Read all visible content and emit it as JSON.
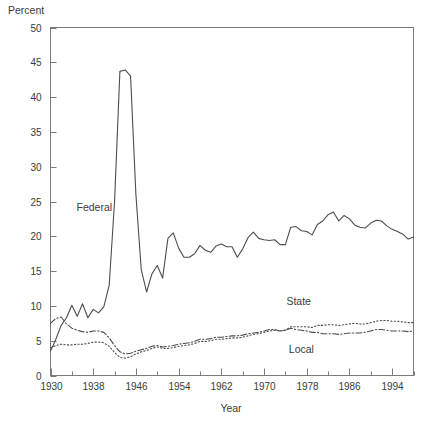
{
  "chart_data": {
    "type": "line",
    "title": "",
    "xlabel": "Year",
    "ylabel": "Percent",
    "ylabel_position": "top-left",
    "xlim": [
      1930,
      1998
    ],
    "ylim": [
      0,
      50
    ],
    "yticks": [
      0,
      5,
      10,
      15,
      20,
      25,
      30,
      35,
      40,
      45,
      50
    ],
    "ytick_labels": [
      "0",
      "5",
      "10",
      "15",
      "20",
      "25",
      "30",
      "35",
      "40",
      "45",
      "50"
    ],
    "xticks_major": [
      1930,
      1938,
      1946,
      1954,
      1962,
      1970,
      1978,
      1986,
      1994
    ],
    "xtick_labels": [
      "1930",
      "1938",
      "1946",
      "1954",
      "1962",
      "1970",
      "1978",
      "1986",
      "1994"
    ],
    "xticks_minor_step": 4,
    "grid": false,
    "legend_position": "inline-annotations",
    "annotations": [
      {
        "text": "Federal",
        "x": 1938.2,
        "y": 23.6
      },
      {
        "text": "State",
        "x": 1976.5,
        "y": 10.2
      },
      {
        "text": "Local",
        "x": 1977.0,
        "y": 3.3
      }
    ],
    "x": [
      1930,
      1931,
      1932,
      1933,
      1934,
      1935,
      1936,
      1937,
      1938,
      1939,
      1940,
      1941,
      1942,
      1943,
      1944,
      1945,
      1946,
      1947,
      1948,
      1949,
      1950,
      1951,
      1952,
      1953,
      1954,
      1955,
      1956,
      1957,
      1958,
      1959,
      1960,
      1961,
      1962,
      1963,
      1964,
      1965,
      1966,
      1967,
      1968,
      1969,
      1970,
      1971,
      1972,
      1973,
      1974,
      1975,
      1976,
      1977,
      1978,
      1979,
      1980,
      1981,
      1982,
      1983,
      1984,
      1985,
      1986,
      1987,
      1988,
      1989,
      1990,
      1991,
      1992,
      1993,
      1994,
      1995,
      1996,
      1997,
      1998
    ],
    "series": [
      {
        "name": "Federal",
        "style": "solid",
        "values": [
          3.5,
          5.2,
          7.2,
          8.3,
          10.1,
          8.5,
          10.3,
          8.3,
          9.5,
          9.0,
          9.9,
          13.0,
          25.0,
          43.7,
          43.9,
          43.0,
          26.0,
          15.2,
          12.0,
          14.6,
          15.8,
          14.0,
          19.7,
          20.5,
          18.3,
          17.0,
          17.0,
          17.5,
          18.7,
          18.0,
          17.7,
          18.6,
          18.9,
          18.5,
          18.5,
          17.0,
          18.2,
          19.8,
          20.6,
          19.7,
          19.5,
          19.4,
          19.5,
          18.8,
          18.8,
          21.3,
          21.4,
          20.8,
          20.7,
          20.2,
          21.7,
          22.2,
          23.1,
          23.5,
          22.2,
          23.0,
          22.5,
          21.6,
          21.3,
          21.2,
          21.9,
          22.3,
          22.2,
          21.5,
          21.0,
          20.7,
          20.3,
          19.6,
          19.9
        ]
      },
      {
        "name": "State",
        "style": "dotted",
        "values": [
          4.0,
          4.3,
          4.5,
          4.4,
          4.4,
          4.5,
          4.5,
          4.6,
          4.8,
          4.8,
          4.7,
          4.2,
          3.3,
          2.6,
          2.5,
          2.7,
          3.1,
          3.4,
          3.6,
          3.9,
          4.1,
          3.9,
          3.9,
          4.0,
          4.2,
          4.3,
          4.4,
          4.6,
          4.9,
          4.9,
          5.0,
          5.2,
          5.2,
          5.3,
          5.4,
          5.4,
          5.5,
          5.7,
          5.9,
          6.0,
          6.2,
          6.4,
          6.5,
          6.4,
          6.5,
          7.0,
          7.0,
          7.0,
          7.0,
          6.9,
          7.2,
          7.2,
          7.3,
          7.3,
          7.2,
          7.3,
          7.4,
          7.5,
          7.4,
          7.4,
          7.6,
          7.8,
          7.9,
          7.9,
          7.8,
          7.8,
          7.7,
          7.6,
          7.6
        ]
      },
      {
        "name": "Local",
        "style": "dashdot",
        "values": [
          7.5,
          8.2,
          8.4,
          7.4,
          6.8,
          6.5,
          6.3,
          6.2,
          6.4,
          6.4,
          6.2,
          5.4,
          4.3,
          3.4,
          3.1,
          3.2,
          3.5,
          3.7,
          3.9,
          4.2,
          4.3,
          4.1,
          4.2,
          4.3,
          4.5,
          4.6,
          4.7,
          4.9,
          5.2,
          5.2,
          5.3,
          5.5,
          5.5,
          5.6,
          5.7,
          5.7,
          5.8,
          6.0,
          6.1,
          6.2,
          6.4,
          6.6,
          6.6,
          6.4,
          6.5,
          6.8,
          6.6,
          6.5,
          6.4,
          6.2,
          6.2,
          6.0,
          6.0,
          6.0,
          5.9,
          6.0,
          6.1,
          6.1,
          6.1,
          6.2,
          6.4,
          6.6,
          6.6,
          6.5,
          6.4,
          6.4,
          6.4,
          6.3,
          6.4
        ]
      }
    ]
  }
}
